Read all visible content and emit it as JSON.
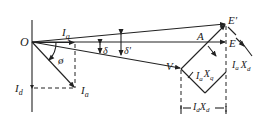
{
  "figure": {
    "type": "phasor-diagram",
    "labels": {
      "origin": "O",
      "iq": "I",
      "iq_sub": "q",
      "id": "I",
      "id_sub": "d",
      "ia": "I",
      "ia_sub": "a",
      "phi": "ø",
      "delta": "δ",
      "delta_prime": "δ'",
      "v": "V",
      "a": "A",
      "e": "E",
      "e_prime": "E'",
      "iaxq_i": "I",
      "iaxq_a": "a",
      "iaxq_x": "X",
      "iaxq_q": "q",
      "iaxd_i": "I",
      "iaxd_a": "a",
      "iaxd_x": "X",
      "iaxd_d": "d",
      "idxd_i": "I",
      "idxd_d": "d",
      "idxd_x": "X",
      "idxd_d2": "d"
    }
  }
}
